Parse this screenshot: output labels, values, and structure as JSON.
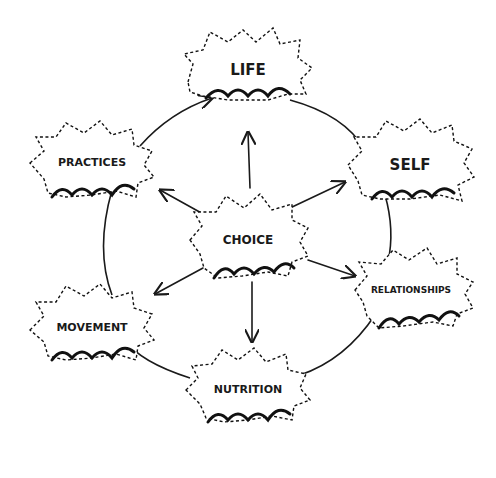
{
  "diagram": {
    "type": "hub-and-cycle",
    "center": {
      "label": "CHOICE",
      "x": 248,
      "y": 240
    },
    "nodes": [
      {
        "id": "life",
        "label": "LIFE",
        "x": 248,
        "y": 72,
        "font_size": 15
      },
      {
        "id": "self",
        "label": "SELF",
        "x": 410,
        "y": 165,
        "font_size": 15
      },
      {
        "id": "relationships",
        "label": "RELATIONSHIPS",
        "x": 413,
        "y": 290,
        "font_size": 9
      },
      {
        "id": "nutrition",
        "label": "NUTRITION",
        "x": 248,
        "y": 390,
        "font_size": 11
      },
      {
        "id": "movement",
        "label": "MOVEMENT",
        "x": 92,
        "y": 326,
        "font_size": 11
      },
      {
        "id": "practices",
        "label": "PRACTICES",
        "x": 92,
        "y": 163,
        "font_size": 11
      }
    ],
    "center_arrows_to": [
      "life",
      "self",
      "relationships",
      "nutrition",
      "movement",
      "practices"
    ],
    "cycle_order": [
      "practices",
      "life",
      "self",
      "relationships",
      "nutrition",
      "movement",
      "practices"
    ],
    "colors": {
      "ink": "#1a1a1a",
      "background": "#ffffff"
    }
  }
}
